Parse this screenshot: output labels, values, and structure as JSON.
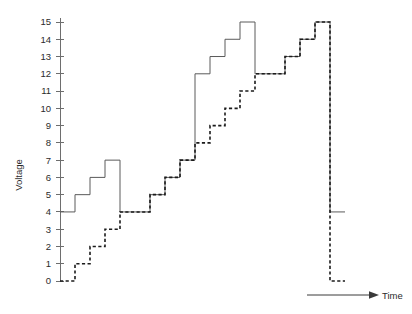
{
  "chart_data": {
    "type": "line",
    "title": "",
    "subtitle": "",
    "xlabel": "Time",
    "ylabel": "Voltage",
    "grid": false,
    "legend_position": "none",
    "xlim": [
      0,
      20
    ],
    "ylim": [
      0,
      15
    ],
    "y_ticks": [
      0,
      1,
      2,
      3,
      4,
      5,
      6,
      7,
      8,
      9,
      10,
      11,
      12,
      13,
      14,
      15
    ],
    "y_tick_labels": [
      "0",
      "1",
      "2",
      "3",
      "4",
      "5",
      "6",
      "7",
      "8",
      "9",
      "10",
      "11",
      "12",
      "13",
      "14",
      "15"
    ],
    "x_ticks": [],
    "x_tick_labels": [],
    "step_interpolation": "post",
    "series": [
      {
        "name": "solid-staircase",
        "style": "solid",
        "color": "#5a5a5a",
        "x": [
          0,
          1,
          2,
          3,
          4,
          5,
          6,
          7,
          8,
          9,
          10,
          11,
          12,
          13,
          14,
          15,
          16,
          17,
          18,
          19
        ],
        "values": [
          4,
          5,
          6,
          7,
          4,
          4,
          5,
          6,
          7,
          12,
          13,
          14,
          15,
          12,
          12,
          13,
          14,
          15,
          4,
          4
        ]
      },
      {
        "name": "dashed-staircase",
        "style": "dashed",
        "color": "#1b1b1b",
        "x": [
          0,
          1,
          2,
          3,
          4,
          5,
          6,
          7,
          8,
          9,
          10,
          11,
          12,
          13,
          14,
          15,
          16,
          17,
          18,
          19
        ],
        "values": [
          0,
          1,
          2,
          3,
          4,
          4,
          5,
          6,
          7,
          8,
          9,
          10,
          11,
          12,
          12,
          13,
          14,
          15,
          0,
          0
        ]
      }
    ],
    "annotations": [
      {
        "name": "time-axis-arrow",
        "label": "Time"
      }
    ]
  },
  "axis": {
    "y_title": "Voltage",
    "x_title": "Time"
  },
  "colors": {
    "solid_series": "#5a5a5a",
    "dashed_series": "#1b1b1b",
    "axis": "#6e6e6e",
    "text": "#2b2b2b",
    "background": "#ffffff"
  }
}
